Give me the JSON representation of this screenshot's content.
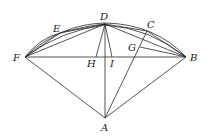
{
  "diagram": {
    "title": "",
    "points": {
      "A": {
        "label": "A",
        "x": 105,
        "y": 118,
        "lx": 101,
        "ly": 131
      },
      "B": {
        "label": "B",
        "x": 186,
        "y": 57,
        "lx": 190,
        "ly": 61
      },
      "C": {
        "label": "C",
        "x": 147,
        "y": 31,
        "lx": 147,
        "ly": 28
      },
      "D": {
        "label": "D",
        "x": 105,
        "y": 24,
        "lx": 100,
        "ly": 20
      },
      "E": {
        "label": "E",
        "x": 60,
        "y": 33,
        "lx": 53,
        "ly": 32
      },
      "F": {
        "label": "F",
        "x": 25,
        "y": 57,
        "lx": 13,
        "ly": 61
      },
      "G": {
        "label": "G",
        "x": 140,
        "y": 47,
        "lx": 128,
        "ly": 51
      },
      "H": {
        "label": "H",
        "x": 96,
        "y": 57,
        "lx": 87,
        "ly": 67
      },
      "I": {
        "label": "I",
        "x": 112,
        "y": 57,
        "lx": 110,
        "ly": 67
      }
    },
    "segments": [
      [
        "F",
        "B"
      ],
      [
        "F",
        "A"
      ],
      [
        "B",
        "A"
      ],
      [
        "D",
        "A"
      ],
      [
        "C",
        "A"
      ],
      [
        "F",
        "D"
      ],
      [
        "D",
        "B"
      ],
      [
        "F",
        "E"
      ],
      [
        "E",
        "D"
      ],
      [
        "D",
        "H"
      ],
      [
        "D",
        "I"
      ],
      [
        "G",
        "B"
      ],
      [
        "C",
        "B"
      ],
      [
        "D",
        "C"
      ]
    ],
    "arcs": [
      "F-D-B outer arc",
      "inner arcs"
    ]
  }
}
